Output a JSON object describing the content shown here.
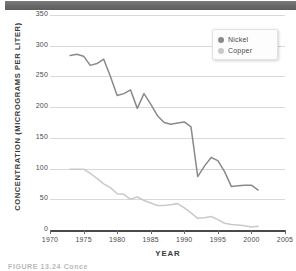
{
  "figure": {
    "caption": "FIGURE 13.24  Conce",
    "top_band_color": "#6e6e6e"
  },
  "legend": {
    "position": "top-right",
    "items": [
      {
        "label": "Nickel",
        "color": "#8a8a8a"
      },
      {
        "label": "Copper",
        "color": "#c9c9c9"
      }
    ]
  },
  "chart_data": {
    "type": "line",
    "title": "",
    "xlabel": "YEAR",
    "ylabel": "CONCENTRATION (MICROGRAMS PER LITER)",
    "xlim": [
      1970,
      2005
    ],
    "ylim": [
      0,
      350
    ],
    "xticks": [
      1970,
      1975,
      1980,
      1985,
      1990,
      1995,
      2000,
      2005
    ],
    "yticks": [
      0,
      50,
      100,
      150,
      200,
      250,
      300,
      350
    ],
    "grid": "horizontal",
    "series": [
      {
        "name": "Nickel",
        "color": "#8a8a8a",
        "x": [
          1973,
          1974,
          1975,
          1976,
          1977,
          1978,
          1979,
          1980,
          1981,
          1982,
          1983,
          1984,
          1985,
          1986,
          1987,
          1988,
          1989,
          1990,
          1991,
          1992,
          1993,
          1994,
          1995,
          1996,
          1997,
          1998,
          1999,
          2000,
          2001
        ],
        "y": [
          284,
          286,
          283,
          268,
          271,
          278,
          250,
          219,
          222,
          228,
          198,
          222,
          205,
          186,
          175,
          172,
          174,
          176,
          168,
          87,
          104,
          118,
          113,
          95,
          71,
          72,
          73,
          73,
          65
        ]
      },
      {
        "name": "Copper",
        "color": "#c9c9c9",
        "x": [
          1973,
          1974,
          1975,
          1976,
          1977,
          1978,
          1979,
          1980,
          1981,
          1982,
          1983,
          1984,
          1985,
          1986,
          1987,
          1988,
          1989,
          1990,
          1991,
          1992,
          1993,
          1994,
          1995,
          1996,
          1997,
          1998,
          1999,
          2000,
          2001
        ],
        "y": [
          99,
          99,
          99,
          92,
          84,
          75,
          69,
          59,
          58,
          50,
          54,
          48,
          44,
          40,
          40,
          41,
          43,
          36,
          28,
          19,
          20,
          22,
          17,
          11,
          9,
          8,
          7,
          5,
          6
        ]
      }
    ]
  }
}
